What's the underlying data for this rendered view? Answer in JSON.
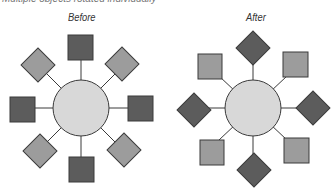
{
  "caption": "Multiple objects rotated individually",
  "panels": [
    {
      "label": "Before",
      "center": [
        81,
        108
      ],
      "radius": 28
    },
    {
      "label": "After",
      "center": [
        253,
        108
      ],
      "radius": 28
    }
  ],
  "colors": {
    "dark": "#5c5c5c",
    "light": "#9c9c9c",
    "circle": "#d8d8d8",
    "stroke": "#3a3a3a"
  }
}
